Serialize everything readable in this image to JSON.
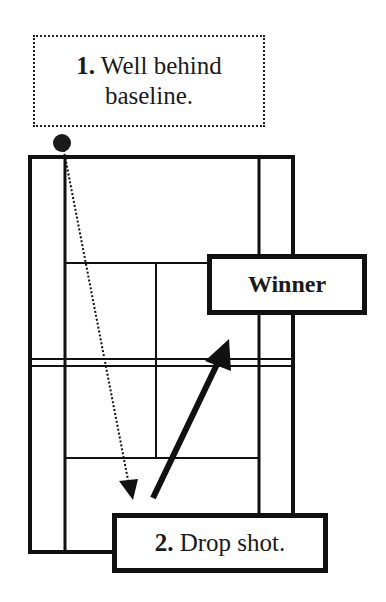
{
  "diagram": {
    "labels": {
      "start": {
        "number": "1.",
        "text_line1": "Well behind",
        "text_line2": "baseline."
      },
      "winner": {
        "text": "Winner"
      },
      "drop": {
        "number": "2.",
        "text": "Drop shot."
      }
    },
    "colors": {
      "line": "#111111",
      "background": "#ffffff"
    },
    "elements": {
      "court": "badminton/tennis court outline with doubles sidelines, singles sidelines, service lines, center line, and net",
      "player_marker": "black dot",
      "shot_paths": [
        {
          "name": "dotted-trajectory",
          "style": "dotted",
          "from": "player behind baseline",
          "to": "front court near net (opponent side)"
        },
        {
          "name": "winner-arrow",
          "style": "solid thick",
          "from": "front court",
          "to": "toward net / winner"
        }
      ]
    }
  }
}
